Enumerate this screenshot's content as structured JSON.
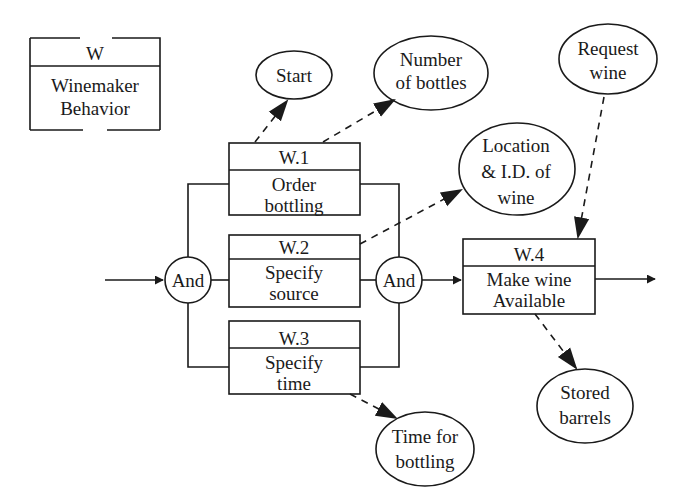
{
  "diagram": {
    "title_box": {
      "id": "W",
      "label_line1": "Winemaker",
      "label_line2": "Behavior"
    },
    "functions": [
      {
        "id": "W.1",
        "line1": "Order",
        "line2": "bottling"
      },
      {
        "id": "W.2",
        "line1": "Specify",
        "line2": "source"
      },
      {
        "id": "W.3",
        "line1": "Specify",
        "line2": "time"
      },
      {
        "id": "W.4",
        "line1": "Make wine",
        "line2": "Available"
      }
    ],
    "gates": [
      {
        "label": "And"
      },
      {
        "label": "And"
      }
    ],
    "items": [
      {
        "line1": "Start",
        "line2": "",
        "line3": ""
      },
      {
        "line1": "Number",
        "line2": "of bottles",
        "line3": ""
      },
      {
        "line1": "Location",
        "line2": "& I.D. of",
        "line3": "wine"
      },
      {
        "line1": "Request",
        "line2": "wine",
        "line3": ""
      },
      {
        "line1": "Stored",
        "line2": "barrels",
        "line3": ""
      },
      {
        "line1": "Time for",
        "line2": "bottling",
        "line3": ""
      }
    ],
    "colors": {
      "ink": "#1a1a1a",
      "background": "#ffffff"
    }
  }
}
